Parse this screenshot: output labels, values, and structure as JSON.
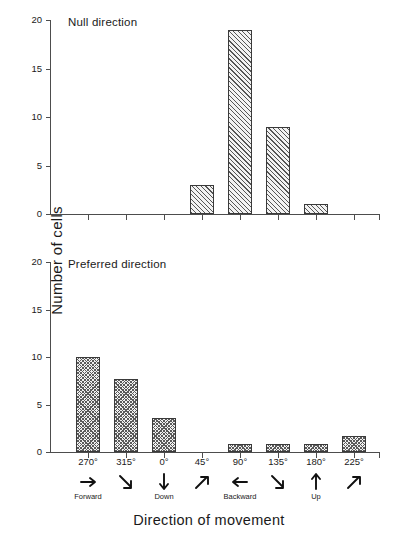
{
  "figure": {
    "xlabel": "Direction of movement",
    "ylabel": "Number of cells"
  },
  "chart_data": {
    "type": "bar",
    "title": "",
    "xlabel": "Direction of movement",
    "ylabel": "Number of cells",
    "ylim": [
      0,
      20
    ],
    "yticks": [
      0,
      5,
      10,
      15,
      20
    ],
    "ytick_labels": [
      "0",
      "5",
      "10",
      "15",
      "20"
    ],
    "grid": false,
    "legend": "none",
    "categories": [
      "270°",
      "315°",
      "0°",
      "45°",
      "90°",
      "135°",
      "180°",
      "225°"
    ],
    "category_arrows": [
      "arrow-right",
      "arrow-down-right",
      "arrow-down",
      "arrow-up-right",
      "arrow-left",
      "arrow-down-right",
      "arrow-up",
      "arrow-up-right"
    ],
    "category_words": [
      "Forward",
      "",
      "Down",
      "",
      "Backward",
      "",
      "Up",
      ""
    ],
    "panels": [
      {
        "name": "null-direction",
        "title": "Null direction",
        "fill": "diagonal-hatch",
        "values": [
          0,
          0,
          0,
          3,
          19,
          9,
          1,
          0
        ]
      },
      {
        "name": "preferred-direction",
        "title": "Preferred direction",
        "fill": "stipple-crosshatch",
        "values": [
          10,
          7.7,
          3.6,
          0,
          0.8,
          0.8,
          0.8,
          1.7
        ]
      }
    ]
  },
  "colors": {
    "axis": "#4d4d4d",
    "bar_edge": "#3a3a3a",
    "bar_fill": "#f0f0f0",
    "text": "#1a1a1a"
  },
  "ticklabels": {
    "y": [
      "0",
      "5",
      "10",
      "15",
      "20"
    ]
  }
}
